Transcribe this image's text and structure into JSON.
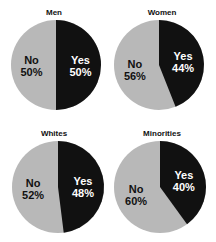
{
  "chart_data": [
    {
      "type": "pie",
      "title": "Men",
      "categories": [
        "Yes",
        "No"
      ],
      "values": [
        50,
        50
      ],
      "colors": [
        "#111111",
        "#b8b8b8"
      ],
      "labels": [
        "Yes\n50%",
        "No\n50%"
      ]
    },
    {
      "type": "pie",
      "title": "Women",
      "categories": [
        "Yes",
        "No"
      ],
      "values": [
        44,
        56
      ],
      "colors": [
        "#111111",
        "#b8b8b8"
      ],
      "labels": [
        "Yes\n44%",
        "No\n56%"
      ]
    },
    {
      "type": "pie",
      "title": "Whites",
      "categories": [
        "Yes",
        "No"
      ],
      "values": [
        48,
        52
      ],
      "colors": [
        "#111111",
        "#b8b8b8"
      ],
      "labels": [
        "Yes\n48%",
        "No\n52%"
      ]
    },
    {
      "type": "pie",
      "title": "Minorities",
      "categories": [
        "Yes",
        "No"
      ],
      "values": [
        40,
        60
      ],
      "colors": [
        "#111111",
        "#b8b8b8"
      ],
      "labels": [
        "Yes\n40%",
        "No\n60%"
      ]
    }
  ],
  "panels": [
    {
      "title": "Men",
      "yes": "Yes",
      "yes_pct": "50%",
      "no": "No",
      "no_pct": "50%"
    },
    {
      "title": "Women",
      "yes": "Yes",
      "yes_pct": "44%",
      "no": "No",
      "no_pct": "56%"
    },
    {
      "title": "Whites",
      "yes": "Yes",
      "yes_pct": "48%",
      "no": "No",
      "no_pct": "52%"
    },
    {
      "title": "Minorities",
      "yes": "Yes",
      "yes_pct": "40%",
      "no": "No",
      "no_pct": "60%"
    }
  ]
}
